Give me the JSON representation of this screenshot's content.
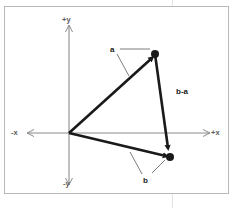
{
  "figure": {
    "background_color": "#ffffff",
    "frame_color": "#b9b9b9",
    "vector_color": "#1a1a1a",
    "axis_color": "#8c8c8c",
    "leader_color": "#6e6e6e",
    "guide_line_color": "#e2e2e2"
  },
  "axes": {
    "origin": {
      "x": 69,
      "y": 133
    },
    "labels": {
      "pos_y": "+y",
      "neg_y": "-y",
      "neg_x": "-x",
      "pos_x": "+x"
    },
    "x_axis": {
      "x1": 24,
      "y1": 133,
      "x2": 214,
      "y2": 133
    },
    "y_axis": {
      "x1": 69,
      "y1": 22,
      "x2": 69,
      "y2": 186
    }
  },
  "vectors": [
    {
      "name": "a",
      "label": "a",
      "from": {
        "x": 69,
        "y": 133
      },
      "to": {
        "x": 155,
        "y": 54
      },
      "has_arrowhead": true,
      "has_endpoint_dot": true
    },
    {
      "name": "b",
      "label": "b",
      "from": {
        "x": 69,
        "y": 133
      },
      "to": {
        "x": 170,
        "y": 157
      },
      "has_arrowhead": true,
      "has_endpoint_dot": true
    },
    {
      "name": "b-a",
      "label": "b-a",
      "from": {
        "x": 155,
        "y": 54
      },
      "to": {
        "x": 170,
        "y": 157
      },
      "has_arrowhead": true,
      "has_endpoint_dot": true
    }
  ],
  "leader_lines": [
    {
      "for": "a",
      "x1": 120,
      "y1": 49,
      "x2": 150,
      "y2": 49
    },
    {
      "for": "a",
      "x1": 117,
      "y1": 53,
      "x2": 129,
      "y2": 75
    },
    {
      "for": "b",
      "x1": 141,
      "y1": 175,
      "x2": 130,
      "y2": 153
    },
    {
      "for": "b",
      "x1": 151,
      "y1": 174,
      "x2": 164,
      "y2": 161
    }
  ]
}
